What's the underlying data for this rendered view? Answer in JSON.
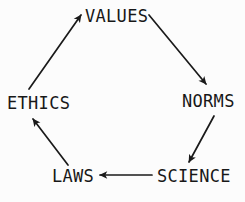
{
  "diagram": {
    "type": "cycle-diagram",
    "title": "",
    "background_color": "#fcfcfc",
    "stroke_color": "#1a1a1a",
    "text_color": "#181818",
    "nodes": [
      {
        "id": "values",
        "label": "VALUES",
        "position": "top"
      },
      {
        "id": "norms",
        "label": "NORMS",
        "position": "right"
      },
      {
        "id": "science",
        "label": "SCIENCE",
        "position": "bottom-right"
      },
      {
        "id": "laws",
        "label": "LAWS",
        "position": "bottom-left"
      },
      {
        "id": "ethics",
        "label": "ETHICS",
        "position": "left"
      }
    ],
    "edges": [
      {
        "id": "values-to-norms",
        "from": "VALUES",
        "to": "NORMS",
        "direction": "down-right"
      },
      {
        "id": "norms-to-science",
        "from": "NORMS",
        "to": "SCIENCE",
        "direction": "down-left"
      },
      {
        "id": "science-to-laws",
        "from": "SCIENCE",
        "to": "LAWS",
        "direction": "left"
      },
      {
        "id": "laws-to-ethics",
        "from": "LAWS",
        "to": "ETHICS",
        "direction": "up-left"
      },
      {
        "id": "ethics-to-values",
        "from": "ETHICS",
        "to": "VALUES",
        "direction": "up-right"
      }
    ]
  }
}
